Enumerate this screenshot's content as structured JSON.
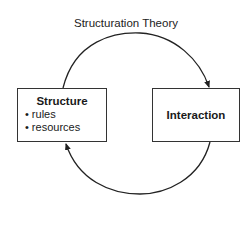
{
  "diagram": {
    "title": "Structuration Theory",
    "nodes": [
      {
        "id": "structure",
        "label": "Structure",
        "items": [
          "rules",
          "resources"
        ]
      },
      {
        "id": "interaction",
        "label": "Interaction"
      }
    ],
    "edges": [
      {
        "from": "structure",
        "to": "interaction",
        "shape": "upper-arc"
      },
      {
        "from": "interaction",
        "to": "structure",
        "shape": "lower-arc"
      }
    ]
  }
}
